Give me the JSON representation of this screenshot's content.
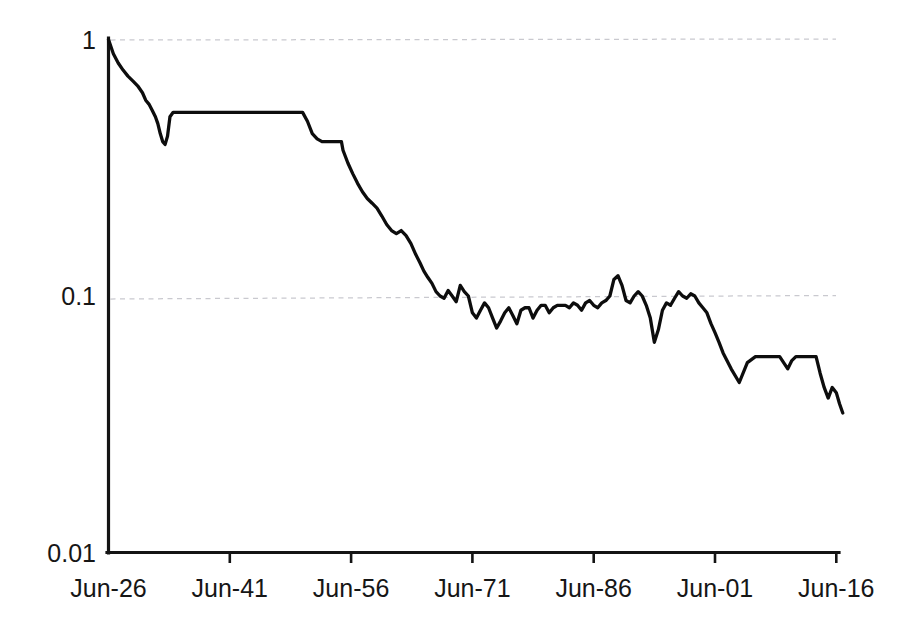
{
  "chart_data": {
    "type": "line",
    "title": "",
    "subtitle": "",
    "xlabel": "",
    "ylabel": "",
    "yscale": "log",
    "ylim": [
      0.01,
      1
    ],
    "grid": true,
    "legend": false,
    "legend_position": "none",
    "line_color": "#0d0d0d",
    "grid_color": "#c9c9cf",
    "axis_color": "#141414",
    "background": "#ffffff",
    "ytick_labels": [
      "1",
      "0.1",
      "0.01"
    ],
    "ytick_values": [
      1,
      0.1,
      0.01
    ],
    "xtick_labels": [
      "Jun-26",
      "Jun-41",
      "Jun-56",
      "Jun-71",
      "Jun-86",
      "Jun-01",
      "Jun-16"
    ],
    "xtick_values": [
      1926,
      1941,
      1956,
      1971,
      1986,
      2001,
      2016
    ],
    "xlim": [
      1926,
      2017
    ],
    "series": [
      {
        "name": "value",
        "x": [
          1926.0,
          1926.6,
          1927.2,
          1927.8,
          1928.4,
          1929.0,
          1929.6,
          1930.2,
          1930.6,
          1931.0,
          1931.4,
          1931.8,
          1932.1,
          1932.4,
          1932.7,
          1933.0,
          1933.3,
          1933.6,
          1934.0,
          1935.0,
          1937.0,
          1939.0,
          1941.0,
          1943.0,
          1945.0,
          1947.0,
          1949.0,
          1950.0,
          1950.6,
          1951.2,
          1951.8,
          1952.4,
          1953.0,
          1953.6,
          1954.2,
          1954.8,
          1955.0,
          1955.6,
          1956.2,
          1956.8,
          1957.4,
          1958.0,
          1958.6,
          1959.2,
          1959.8,
          1960.4,
          1961.0,
          1961.6,
          1962.2,
          1962.8,
          1963.4,
          1964.0,
          1964.5,
          1965.0,
          1965.5,
          1966.0,
          1966.5,
          1967.0,
          1967.5,
          1968.0,
          1968.5,
          1969.0,
          1969.5,
          1970.0,
          1970.5,
          1971.0,
          1971.5,
          1972.0,
          1972.5,
          1973.0,
          1973.5,
          1974.0,
          1974.5,
          1975.0,
          1975.5,
          1976.0,
          1976.5,
          1977.0,
          1977.5,
          1978.0,
          1978.5,
          1979.0,
          1979.5,
          1980.0,
          1980.5,
          1981.0,
          1981.5,
          1982.0,
          1982.5,
          1983.0,
          1983.5,
          1984.0,
          1984.5,
          1985.0,
          1985.5,
          1986.0,
          1986.5,
          1987.0,
          1987.5,
          1988.0,
          1988.5,
          1989.0,
          1989.5,
          1990.0,
          1990.5,
          1991.0,
          1991.5,
          1992.0,
          1992.5,
          1993.0,
          1993.5,
          1994.0,
          1994.5,
          1995.0,
          1995.5,
          1996.0,
          1996.5,
          1997.0,
          1997.5,
          1998.0,
          1998.5,
          1999.0,
          1999.5,
          2000.0,
          2000.5,
          2001.0,
          2001.5,
          2002.0,
          2003.0,
          2004.0,
          2005.0,
          2006.0,
          2007.0,
          2008.0,
          2009.0,
          2010.0,
          2010.5,
          2011.0,
          2012.0,
          2013.0,
          2013.5,
          2014.0,
          2014.5,
          2015.0,
          2015.5,
          2016.0,
          2016.4,
          2016.8
        ],
        "y": [
          1.0,
          0.88,
          0.81,
          0.76,
          0.72,
          0.69,
          0.66,
          0.62,
          0.58,
          0.56,
          0.53,
          0.5,
          0.47,
          0.43,
          0.4,
          0.39,
          0.42,
          0.5,
          0.52,
          0.52,
          0.52,
          0.52,
          0.52,
          0.52,
          0.52,
          0.52,
          0.52,
          0.52,
          0.48,
          0.43,
          0.41,
          0.4,
          0.4,
          0.4,
          0.4,
          0.4,
          0.37,
          0.33,
          0.3,
          0.275,
          0.255,
          0.24,
          0.23,
          0.22,
          0.205,
          0.19,
          0.18,
          0.175,
          0.18,
          0.172,
          0.16,
          0.145,
          0.135,
          0.125,
          0.118,
          0.112,
          0.104,
          0.1,
          0.098,
          0.105,
          0.1,
          0.095,
          0.11,
          0.104,
          0.1,
          0.086,
          0.082,
          0.088,
          0.094,
          0.09,
          0.082,
          0.075,
          0.08,
          0.086,
          0.09,
          0.084,
          0.078,
          0.088,
          0.09,
          0.09,
          0.082,
          0.088,
          0.092,
          0.092,
          0.086,
          0.09,
          0.092,
          0.092,
          0.092,
          0.09,
          0.094,
          0.092,
          0.088,
          0.094,
          0.096,
          0.092,
          0.09,
          0.094,
          0.096,
          0.1,
          0.116,
          0.12,
          0.11,
          0.096,
          0.094,
          0.1,
          0.104,
          0.1,
          0.092,
          0.082,
          0.066,
          0.074,
          0.088,
          0.094,
          0.092,
          0.098,
          0.104,
          0.1,
          0.098,
          0.102,
          0.1,
          0.094,
          0.09,
          0.086,
          0.078,
          0.072,
          0.066,
          0.06,
          0.052,
          0.046,
          0.055,
          0.058,
          0.058,
          0.058,
          0.058,
          0.052,
          0.056,
          0.058,
          0.058,
          0.058,
          0.058,
          0.05,
          0.044,
          0.04,
          0.044,
          0.042,
          0.038,
          0.035
        ]
      }
    ]
  },
  "axes": {
    "y_axis_name": "y-axis",
    "x_axis_name": "x-axis"
  }
}
